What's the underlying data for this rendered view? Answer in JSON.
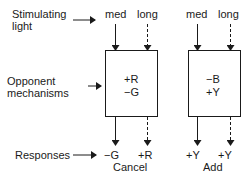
{
  "row_labels": {
    "stimulating_line1": "Stimulating",
    "stimulating_line2": "light",
    "opponent_line1": "Opponent",
    "opponent_line2": "mechanisms",
    "responses": "Responses"
  },
  "panels": [
    {
      "inputs": [
        "med",
        "long"
      ],
      "box_lines": [
        "+R",
        "−G"
      ],
      "outputs": [
        "−G",
        "+R"
      ],
      "result": "Cancel"
    },
    {
      "inputs": [
        "med",
        "long"
      ],
      "box_lines": [
        "−B",
        "+Y"
      ],
      "outputs": [
        "+Y",
        "+Y"
      ],
      "result": "Add"
    }
  ],
  "arrow_styles": {
    "med": "solid",
    "long": "dashed"
  }
}
